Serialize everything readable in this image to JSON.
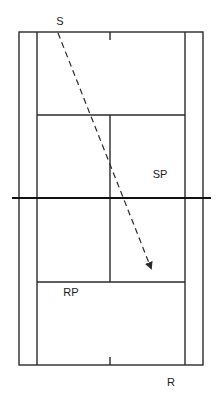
{
  "diagram": {
    "labels": {
      "server": "S",
      "server_partner": "SP",
      "receiver_partner": "RP",
      "receiver": "R"
    },
    "colors": {
      "line": "#2a2a2a",
      "net": "#111111",
      "background": "#ffffff"
    },
    "serve_path": {
      "from": [
        58,
        33
      ],
      "to": [
        151,
        268
      ],
      "style": "dashed-arrow"
    }
  }
}
